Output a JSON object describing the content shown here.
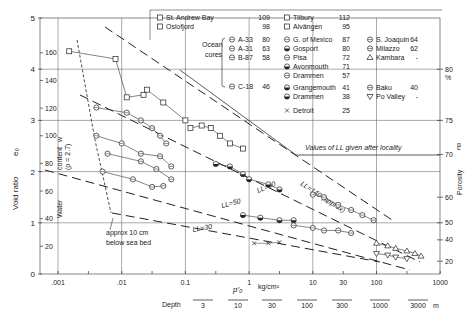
{
  "chart_data": {
    "type": "scatter",
    "title": "",
    "xlabel": "p'0 (kg/cm2)",
    "x_scale": "log",
    "xlim": [
      0.001,
      1000
    ],
    "x_ticks": [
      ".001",
      ".01",
      "0.1",
      "1",
      "10",
      "30",
      "100",
      "1000"
    ],
    "x_unit": "kg/cm²",
    "ylabel": "Void ratio e0",
    "ylim": [
      0,
      5
    ],
    "y_ticks": [
      "0",
      "1",
      "2",
      "3",
      "4",
      "5"
    ],
    "water_content_axis": {
      "label": "Water content w (ρ = 2.7)",
      "ticks": [
        "20",
        "40",
        "60",
        "80",
        "100",
        "120",
        "140",
        "160"
      ]
    },
    "porosity_axis": {
      "label": "Porosity n",
      "unit": "%",
      "ticks": [
        "20",
        "40",
        "50",
        "60",
        "70",
        "75",
        "80"
      ]
    },
    "depth_axis": {
      "label": "Depth",
      "ticks": [
        "3",
        "10",
        "30",
        "100",
        "300",
        "1000",
        "3000"
      ],
      "unit": "m"
    },
    "grid": true,
    "reference_lines": [
      {
        "label": "LL=140 (approx)",
        "style": "dashed"
      },
      {
        "label": "LL=90",
        "style": "dashed"
      },
      {
        "label": "LL=50",
        "style": "dashed"
      },
      {
        "label": "LL=30",
        "style": "dashed"
      }
    ],
    "annotations": [
      "Values of LL given after locality",
      "approx 10 cm below sea bed",
      "c"
    ],
    "legend": [
      {
        "name": "St. Andrew Bay",
        "LL": "109",
        "marker": "square-cross"
      },
      {
        "name": "Oslofjord",
        "LL": "98",
        "marker": "square"
      },
      {
        "name": "Ocean cores A-33",
        "LL": "80",
        "marker": "circle-h"
      },
      {
        "name": "Ocean cores A-31",
        "LL": "63",
        "marker": "circle-v"
      },
      {
        "name": "Ocean cores B-87",
        "LL": "58",
        "marker": "circle-x"
      },
      {
        "name": "Ocean cores C-18",
        "LL": "46",
        "marker": "circle-slash"
      },
      {
        "name": "Tilbury",
        "LL": "112",
        "marker": "square-half"
      },
      {
        "name": "Alvängen",
        "LL": "95",
        "marker": "square-bar"
      },
      {
        "name": "G. of Mexico",
        "LL": "87",
        "marker": "circle-left"
      },
      {
        "name": "Gosport",
        "LL": "80",
        "marker": "circle-bottom"
      },
      {
        "name": "Pisa",
        "LL": "72",
        "marker": "circle-mid"
      },
      {
        "name": "Avonmouth",
        "LL": "71",
        "marker": "circle-top"
      },
      {
        "name": "Drammen",
        "LL": "57",
        "marker": "circle-right"
      },
      {
        "name": "Grangemouth",
        "LL": "41",
        "marker": "circle-lhalf"
      },
      {
        "name": "Drammen",
        "LL": "38",
        "marker": "circle-quarter"
      },
      {
        "name": "Detroit",
        "LL": "25",
        "marker": "x"
      },
      {
        "name": "S. Joaquin",
        "LL": "64",
        "marker": "circle-grid"
      },
      {
        "name": "Milazzo",
        "LL": "62",
        "marker": "circle-dot"
      },
      {
        "name": "Kambara",
        "LL": "-",
        "marker": "triangle-up"
      },
      {
        "name": "Baku",
        "LL": "40",
        "marker": "circle-plus"
      },
      {
        "name": "Po Valley",
        "LL": "-",
        "marker": "triangle-down"
      }
    ],
    "series": [
      {
        "name": "St. Andrew Bay",
        "points": [
          [
            0.0015,
            4.35
          ],
          [
            0.008,
            4.2
          ],
          [
            0.012,
            3.45
          ],
          [
            0.022,
            3.5
          ]
        ]
      },
      {
        "name": "Oslofjord",
        "points": [
          [
            0.025,
            3.6
          ],
          [
            0.045,
            3.35
          ],
          [
            0.1,
            3.0
          ]
        ]
      },
      {
        "name": "Ocean cores",
        "points": [
          [
            0.004,
            3.25
          ],
          [
            0.012,
            3.15
          ],
          [
            0.02,
            3.0
          ],
          [
            0.03,
            2.85
          ],
          [
            0.04,
            2.7
          ],
          [
            0.05,
            2.55
          ]
        ]
      },
      {
        "name": "Ocean cores (lower)",
        "points": [
          [
            0.004,
            2.7
          ],
          [
            0.01,
            2.55
          ],
          [
            0.02,
            2.35
          ],
          [
            0.04,
            2.3
          ],
          [
            0.06,
            2.1
          ]
        ]
      },
      {
        "name": "Ocean cores (low 2)",
        "points": [
          [
            0.006,
            2.35
          ],
          [
            0.02,
            2.2
          ],
          [
            0.035,
            2.05
          ],
          [
            0.06,
            1.85
          ]
        ]
      },
      {
        "name": "Ocean cores (low 3)",
        "points": [
          [
            0.005,
            2.0
          ],
          [
            0.015,
            1.85
          ],
          [
            0.03,
            1.7
          ],
          [
            0.045,
            1.72
          ]
        ]
      },
      {
        "name": "Tilbury / Alvängen",
        "points": [
          [
            0.12,
            2.85
          ],
          [
            0.18,
            2.9
          ],
          [
            0.25,
            2.85
          ],
          [
            0.35,
            2.7
          ],
          [
            0.5,
            2.55
          ],
          [
            0.8,
            2.45
          ]
        ]
      },
      {
        "name": "G. of Mexico / Gosport / Pisa",
        "points": [
          [
            0.3,
            2.15
          ],
          [
            0.5,
            2.1
          ],
          [
            0.8,
            1.95
          ],
          [
            1.0,
            1.85
          ],
          [
            2.0,
            1.75
          ],
          [
            3.0,
            1.65
          ]
        ]
      },
      {
        "name": "S. Joaquin / Milazzo",
        "points": [
          [
            10,
            1.55
          ],
          [
            15,
            1.5
          ],
          [
            25,
            1.35
          ],
          [
            40,
            1.25
          ],
          [
            60,
            1.15
          ],
          [
            90,
            1.05
          ]
        ]
      },
      {
        "name": "Grangemouth / Drammen",
        "points": [
          [
            0.8,
            1.15
          ],
          [
            1.5,
            1.1
          ],
          [
            3,
            1.05
          ],
          [
            5,
            1.05
          ]
        ]
      },
      {
        "name": "Baku",
        "points": [
          [
            5,
            0.95
          ],
          [
            10,
            0.9
          ],
          [
            15,
            0.85
          ],
          [
            25,
            0.85
          ],
          [
            40,
            0.8
          ]
        ]
      },
      {
        "name": "Kambara",
        "points": [
          [
            100,
            0.6
          ],
          [
            150,
            0.55
          ],
          [
            200,
            0.5
          ],
          [
            300,
            0.45
          ],
          [
            400,
            0.4
          ],
          [
            500,
            0.35
          ]
        ]
      },
      {
        "name": "Po Valley",
        "points": [
          [
            100,
            0.4
          ],
          [
            150,
            0.37
          ],
          [
            200,
            0.33
          ],
          [
            300,
            0.3
          ]
        ]
      },
      {
        "name": "Detroit",
        "points": [
          [
            1.2,
            0.6
          ],
          [
            2,
            0.6
          ],
          [
            3,
            0.62
          ]
        ]
      }
    ]
  },
  "labels": {
    "y_axis_title": "Void ratio",
    "y_axis_sym": "e₀",
    "water_title": "Water",
    "water_title2": "content",
    "water_sub": "(ρ = 2.7)",
    "water_sym": "w",
    "porosity_title": "Porosity",
    "porosity_sym": "n",
    "porosity_pct": "%",
    "x_unit": "kg/cm²",
    "x_sym": "p′₀",
    "depth_label": "Depth",
    "depth_unit": "m",
    "ll_note": "Values of LL given after locality",
    "seabed_1": "approx  10  cm",
    "seabed_2": "below  sea  bed",
    "ocean_1": "Ocean",
    "ocean_2": "cores",
    "corner_c": "c",
    "ll140": "LL=140 (approx)",
    "ll90": "LL=90",
    "ll50": "LL=50",
    "ll30": "LL=30"
  }
}
